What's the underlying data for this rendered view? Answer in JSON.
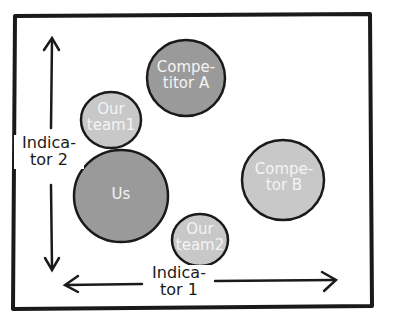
{
  "diagram": {
    "type": "positioning-bubble-map",
    "axes": {
      "x": {
        "label_line1": "Indica-",
        "label_line2": "tor 1"
      },
      "y": {
        "label_line1": "Indica-",
        "label_line2": "tor 2"
      }
    },
    "bubbles": [
      {
        "id": "competitor-a",
        "line1": "Compe-",
        "line2": "titor A",
        "fill": "#9a9a9a"
      },
      {
        "id": "our-team1",
        "line1": "Our",
        "line2": "team1",
        "fill": "#c8c8c8"
      },
      {
        "id": "us",
        "line1": "Us",
        "line2": "",
        "fill": "#9a9a9a"
      },
      {
        "id": "competitor-b",
        "line1": "Compe-",
        "line2": "tor B",
        "fill": "#c8c8c8"
      },
      {
        "id": "our-team2",
        "line1": "Our",
        "line2": "team2",
        "fill": "#c8c8c8"
      }
    ],
    "colors": {
      "stroke": "#1a1a1a",
      "dark_fill": "#9a9a9a",
      "light_fill": "#c8c8c8",
      "text_on_bubble": "#f4f4f4"
    }
  }
}
